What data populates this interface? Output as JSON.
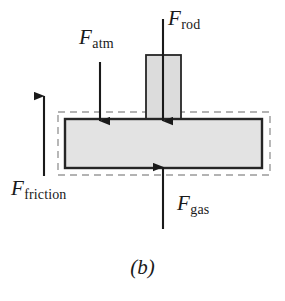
{
  "figure": {
    "caption": "(b)",
    "kind": "free-body-diagram",
    "title_present": false
  },
  "colors": {
    "body_fill": "#e3e3e3",
    "body_stroke": "#262626",
    "rod_fill": "#dcdcdc",
    "rod_stroke": "#262626",
    "dashed_boundary": "#9a9a9a",
    "arrow": "#1a1a1a",
    "text": "#1a1a1a",
    "background": "#ffffff"
  },
  "labels": {
    "f_atm": {
      "symbol": "F",
      "subscript": "atm"
    },
    "f_rod": {
      "symbol": "F",
      "subscript": "rod"
    },
    "f_friction": {
      "symbol": "F",
      "subscript": "friction"
    },
    "f_gas": {
      "symbol": "F",
      "subscript": "gas"
    }
  },
  "shapes": {
    "piston_plate": {
      "x": 65,
      "y": 119,
      "width": 197,
      "height": 49
    },
    "rod": {
      "x": 146,
      "y": 55,
      "width": 35,
      "height": 64
    },
    "dashed_boundary": {
      "x": 58,
      "y": 112,
      "width": 212,
      "height": 63
    }
  },
  "arrows": [
    {
      "name": "f-atm-arrow",
      "direction": "down",
      "x": 100,
      "from_y": 62,
      "to_y": 121
    },
    {
      "name": "f-rod-arrow",
      "direction": "down",
      "x": 163,
      "from_y": 19,
      "to_y": 121
    },
    {
      "name": "f-friction-arrow",
      "direction": "up",
      "x": 44,
      "from_y": 176,
      "to_y": 96
    },
    {
      "name": "f-gas-arrow",
      "direction": "up",
      "x": 163,
      "from_y": 229,
      "to_y": 167
    }
  ]
}
